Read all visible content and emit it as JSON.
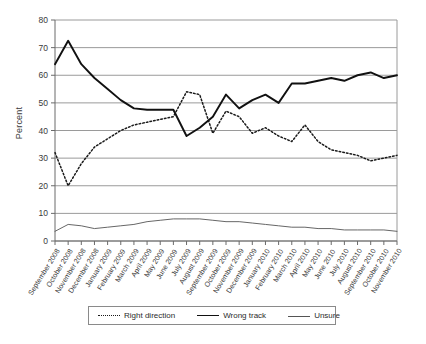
{
  "chart_data": {
    "type": "line",
    "title": "",
    "xlabel": "",
    "ylabel": "Percent",
    "ylim": [
      0,
      80
    ],
    "yticks": [
      0,
      10,
      20,
      30,
      40,
      50,
      60,
      70,
      80
    ],
    "grid": true,
    "legend_position": "bottom",
    "categories": [
      "September 2008",
      "October 2008",
      "November 2008",
      "December 2008",
      "January 2009",
      "February 2009",
      "March 2009",
      "April 2009",
      "May 2009",
      "June 2009",
      "July 2009",
      "August 2009",
      "September 2009",
      "October 2009",
      "November 2009",
      "December 2009",
      "January 2010",
      "February 2010",
      "March 2010",
      "April 2010",
      "May 2010",
      "June 2010",
      "July 2010",
      "August 2010",
      "September 2010",
      "October 2010",
      "November 2010"
    ],
    "series": [
      {
        "name": "Right direction",
        "style": "dotted",
        "color": "#1a1a1a",
        "values": [
          32,
          20,
          28,
          34,
          37,
          40,
          42,
          43,
          44,
          45,
          54,
          53,
          39,
          47,
          45,
          39,
          41,
          38,
          36,
          42,
          36,
          33,
          32,
          31,
          29,
          30,
          31
        ]
      },
      {
        "name": "Wrong track",
        "style": "solid-bold",
        "color": "#111111",
        "values": [
          64,
          72.5,
          64,
          59,
          55,
          51,
          48,
          47.5,
          47.5,
          47.5,
          38,
          41,
          45,
          53,
          48,
          51,
          53,
          50,
          57,
          57,
          58,
          59,
          58,
          60,
          61,
          59,
          60
        ]
      },
      {
        "name": "Unsure",
        "style": "solid-thin",
        "color": "#555555",
        "values": [
          3.5,
          6,
          5.5,
          4.5,
          5,
          5.5,
          6,
          7,
          7.5,
          8,
          8,
          8,
          7.5,
          7,
          7,
          6.5,
          6,
          5.5,
          5,
          5,
          4.5,
          4.5,
          4,
          4,
          4,
          4,
          3.5
        ]
      }
    ]
  },
  "legend": {
    "items": [
      {
        "label": "Right direction"
      },
      {
        "label": "Wrong track"
      },
      {
        "label": "Unsure"
      }
    ]
  },
  "axis": {
    "y_title": "Percent"
  },
  "caption": {
    "text": ""
  }
}
